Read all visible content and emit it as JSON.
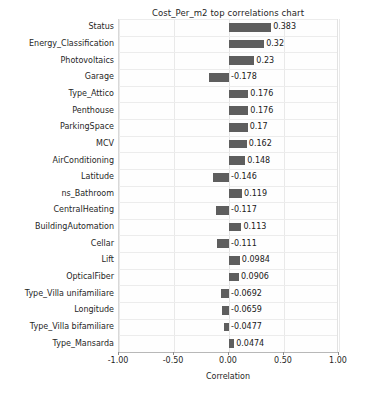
{
  "chart_data": {
    "type": "bar",
    "orientation": "horizontal",
    "title": "Cost_Per_m2 top correlations chart",
    "xlabel": "Correlation",
    "ylabel": "",
    "xlim": [
      -1.0,
      1.0
    ],
    "xticks": [
      "-1.00",
      "-0.50",
      "0.00",
      "0.50",
      "1.00"
    ],
    "xtick_values": [
      -1.0,
      -0.5,
      0.0,
      0.5,
      1.0
    ],
    "grid": true,
    "legend": null,
    "bar_color": "#5e5e5e",
    "categories": [
      "Status",
      "Energy_Classification",
      "Photovoltaics",
      "Garage",
      "Type_Attico",
      "Penthouse",
      "ParkingSpace",
      "MCV",
      "AirConditioning",
      "Latitude",
      "ns_Bathroom",
      "CentralHeating",
      "BuildingAutomation",
      "Cellar",
      "Lift",
      "OpticalFiber",
      "Type_Villa unifamiliare",
      "Longitude",
      "Type_Villa bifamiliare",
      "Type_Mansarda"
    ],
    "values": [
      0.383,
      0.32,
      0.23,
      -0.178,
      0.176,
      0.176,
      0.17,
      0.162,
      0.148,
      -0.146,
      0.119,
      -0.117,
      0.113,
      -0.111,
      0.0984,
      0.0906,
      -0.0692,
      -0.0659,
      -0.0477,
      0.0474
    ],
    "value_labels": [
      "0.383",
      "0.32",
      "0.23",
      "-0.178",
      "0.176",
      "0.176",
      "0.17",
      "0.162",
      "0.148",
      "-0.146",
      "0.119",
      "-0.117",
      "0.113",
      "-0.111",
      "0.0984",
      "0.0906",
      "-0.0692",
      "-0.0659",
      "-0.0477",
      "0.0474"
    ]
  }
}
